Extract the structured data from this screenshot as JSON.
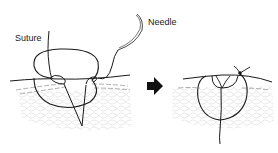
{
  "figure": {
    "labels": {
      "suture": "Suture",
      "needle": "Needle"
    },
    "panels": [
      {
        "id": "before",
        "description": "Suture passed through skin layers with needle, loop open"
      },
      {
        "id": "after",
        "description": "Suture tied, knot on skin surface, wound edges everted"
      }
    ],
    "arrow": "right-arrow",
    "colors": {
      "line": "#1a1a1a",
      "tissue": "#c8c8c8",
      "dermis": "#9a9a9a",
      "background": "#ffffff"
    }
  }
}
